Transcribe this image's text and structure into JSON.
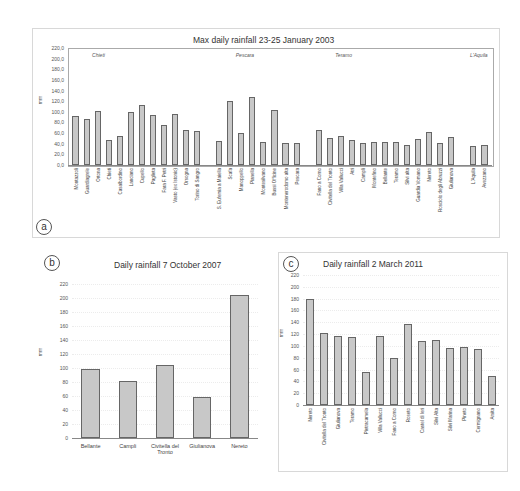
{
  "chart_data": [
    {
      "id": "a",
      "type": "bar",
      "panel_letter": "a",
      "title": "Max daily rainfall 23-25 January 2003",
      "xlabel": "",
      "ylabel": "mm",
      "ylim": [
        0,
        220
      ],
      "yticks": [
        "0,0",
        "20,0",
        "40,0",
        "60,0",
        "80,0",
        "100,0",
        "120,0",
        "140,0",
        "160,0",
        "180,0",
        "200,0",
        "220,0"
      ],
      "grid": false,
      "regions": [
        {
          "name": "Chieti",
          "start": 0
        },
        {
          "name": "Pescara",
          "start": 13
        },
        {
          "name": "Teramo",
          "start": 22
        },
        {
          "name": "L'Aquila",
          "start": 37
        }
      ],
      "categories": [
        "Montazzoli",
        "Guardiagrele",
        "Ortona",
        "Chieti",
        "Casalbordino",
        "Lanciano",
        "Cupello",
        "Paglieta",
        "Fara F. Petri",
        "Vasto (ex Istonio)",
        "Orsogna",
        "Torino di Sangro",
        null,
        "S. Eufemia a Maiella",
        "Scafa",
        "Manoppello",
        "Pianella",
        "Montesilvano",
        "Bussi Officine",
        "Montenerodomo alta",
        "Pescara",
        null,
        "Fano a Corno",
        "Civitella del Tronto",
        "Villa Vallucci",
        "Atri",
        "Campli",
        "Montefino",
        "Bellante",
        "Teramo",
        "Silvi alta",
        "Guardia Vomano",
        "Nereto",
        "Rosciolo degli Abruzzi",
        "Giulianova",
        null,
        "L'Aquila",
        "Avezzano"
      ],
      "values": [
        93,
        86,
        101,
        47,
        54,
        100,
        113,
        94,
        75,
        96,
        66,
        64,
        null,
        46,
        120,
        61,
        127,
        43,
        103,
        41,
        41,
        null,
        66,
        50,
        55,
        47,
        42,
        43,
        43,
        43,
        37,
        48,
        62,
        42,
        53,
        null,
        36,
        38
      ]
    },
    {
      "id": "b",
      "type": "bar",
      "panel_letter": "b",
      "title": "Daily rainfall 7 October 2007",
      "xlabel": "",
      "ylabel": "mm",
      "ylim": [
        0,
        220
      ],
      "yticks": [
        "0",
        "20",
        "40",
        "60",
        "80",
        "100",
        "120",
        "140",
        "160",
        "180",
        "200",
        "220"
      ],
      "grid": true,
      "categories": [
        "Bellante",
        "Campli",
        "Civitella del Tronto",
        "Giulianova",
        "Nereto"
      ],
      "values": [
        98,
        82,
        104,
        59,
        204
      ]
    },
    {
      "id": "c",
      "type": "bar",
      "panel_letter": "c",
      "title": "Daily rainfall 2 March 2011",
      "xlabel": "",
      "ylabel": "mm",
      "ylim": [
        0,
        220
      ],
      "yticks": [
        "0",
        "20",
        "40",
        "60",
        "80",
        "100",
        "120",
        "140",
        "160",
        "180",
        "200",
        "220"
      ],
      "grid": true,
      "categories": [
        "Nereto",
        "Civitella del Tronto",
        "Giulianova",
        "Teramo",
        "Pietracamela",
        "Villa Vallucci",
        "Fano a Corno",
        "Roseto",
        "Castel di Ieri",
        "Silvi Alta",
        "Silvi Marina",
        "Pineto",
        "Cermignano",
        "Arsita"
      ],
      "values": [
        180,
        122,
        117,
        115,
        56,
        117,
        79,
        137,
        108,
        110,
        96,
        98,
        94,
        49
      ]
    }
  ],
  "colors": {
    "bar_fill": "#c8c8c8",
    "bar_border": "#666666",
    "frame": "#aaaaaa"
  }
}
